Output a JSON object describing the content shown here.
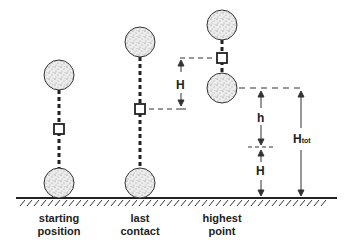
{
  "diagram": {
    "colors": {
      "ink": "#222222",
      "ball_fill": "#e6e6e6",
      "background": "#ffffff"
    },
    "positions": [
      {
        "id": "starting-position",
        "label": "starting\nposition"
      },
      {
        "id": "last-contact",
        "label": "last\ncontact"
      },
      {
        "id": "highest-point",
        "label": "highest\npoint"
      }
    ],
    "dimensions": {
      "H_left": "H",
      "h": "h",
      "H_right": "H",
      "H_tot_main": "H",
      "H_tot_sub": "tot"
    }
  }
}
